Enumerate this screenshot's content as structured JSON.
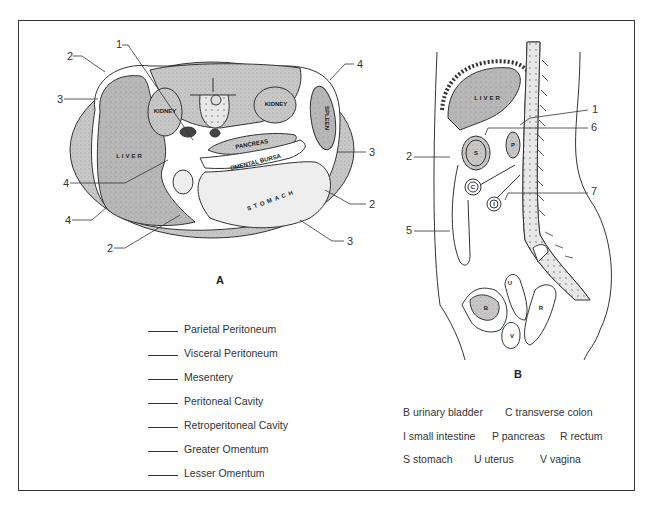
{
  "figure_a": {
    "letter": "A",
    "organ_labels": {
      "liver": "LIVER",
      "kidney_left": "KIDNEY",
      "kidney_right": "KIDNEY",
      "spleen": "SPLEEN",
      "pancreas": "PANCREAS",
      "omental_bursa": "OMENTAL BURSA",
      "stomach": "STOMACH"
    },
    "callouts": [
      {
        "num": "1",
        "x": 116,
        "y": 45
      },
      {
        "num": "2",
        "x": 67,
        "y": 56
      },
      {
        "num": "3",
        "x": 58,
        "y": 99
      },
      {
        "num": "4",
        "x": 64,
        "y": 183
      },
      {
        "num": "4",
        "x": 66,
        "y": 220
      },
      {
        "num": "2",
        "x": 108,
        "y": 248
      },
      {
        "num": "4",
        "x": 358,
        "y": 64
      },
      {
        "num": "3",
        "x": 370,
        "y": 152
      },
      {
        "num": "2",
        "x": 370,
        "y": 204
      },
      {
        "num": "3",
        "x": 348,
        "y": 241
      }
    ]
  },
  "figure_b": {
    "letter": "B",
    "organ_labels": {
      "liver": "LIVER",
      "stomach": "S",
      "pancreas": "P",
      "colon": "C",
      "intestine": "I",
      "uterus": "U",
      "bladder": "B",
      "vagina": "V",
      "rectum": "R"
    },
    "callouts": [
      {
        "num": "1",
        "x": 593,
        "y": 108
      },
      {
        "num": "6",
        "x": 592,
        "y": 126
      },
      {
        "num": "2",
        "x": 407,
        "y": 155
      },
      {
        "num": "7",
        "x": 592,
        "y": 190
      },
      {
        "num": "5",
        "x": 407,
        "y": 229
      }
    ]
  },
  "terms": [
    "Parietal Peritoneum",
    "Visceral Peritoneum",
    "Mesentery",
    "Peritoneal Cavity",
    "Retroperitoneal Cavity",
    "Greater Omentum",
    "Lesser Omentum"
  ],
  "key": {
    "row1": [
      "B urinary bladder",
      "C transverse colon"
    ],
    "row2": [
      "I small intestine",
      "P pancreas",
      "R rectum"
    ],
    "row3": [
      "S stomach",
      "U uterus",
      "V vagina"
    ]
  }
}
